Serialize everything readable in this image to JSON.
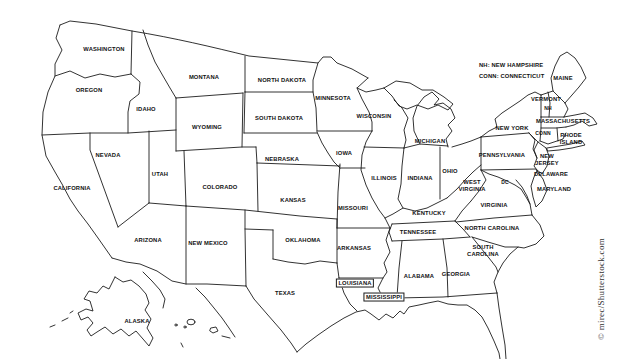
{
  "map": {
    "legend": {
      "line1": "NH: NEW HAMPSHIRE",
      "line2": "CONN: CONNECTICUT"
    },
    "labels": [
      {
        "text": "WASHINGTON",
        "x": 104,
        "y": 49
      },
      {
        "text": "OREGON",
        "x": 89,
        "y": 90
      },
      {
        "text": "IDAHO",
        "x": 146,
        "y": 109
      },
      {
        "text": "MONTANA",
        "x": 204,
        "y": 77
      },
      {
        "text": "WYOMING",
        "x": 207,
        "y": 127
      },
      {
        "text": "NORTH DAKOTA",
        "x": 282,
        "y": 80
      },
      {
        "text": "SOUTH DAKOTA",
        "x": 279,
        "y": 118
      },
      {
        "text": "MINNESOTA",
        "x": 333,
        "y": 98
      },
      {
        "text": "WISCONSIN",
        "x": 374,
        "y": 116
      },
      {
        "text": "MICHIGAN",
        "x": 430,
        "y": 141
      },
      {
        "text": "NEVADA",
        "x": 108,
        "y": 155
      },
      {
        "text": "UTAH",
        "x": 160,
        "y": 174
      },
      {
        "text": "COLORADO",
        "x": 220,
        "y": 187
      },
      {
        "text": "NEBRASKA",
        "x": 282,
        "y": 159
      },
      {
        "text": "IOWA",
        "x": 344,
        "y": 153
      },
      {
        "text": "KANSAS",
        "x": 293,
        "y": 200
      },
      {
        "text": "MISSOURI",
        "x": 353,
        "y": 208
      },
      {
        "text": "ILLINOIS",
        "x": 384,
        "y": 178
      },
      {
        "text": "INDIANA",
        "x": 420,
        "y": 178
      },
      {
        "text": "OHIO",
        "x": 450,
        "y": 171
      },
      {
        "text": "CALIFORNIA",
        "x": 72,
        "y": 188
      },
      {
        "text": "ARIZONA",
        "x": 148,
        "y": 240
      },
      {
        "text": "NEW MEXICO",
        "x": 208,
        "y": 243
      },
      {
        "text": "OKLAHOMA",
        "x": 303,
        "y": 240
      },
      {
        "text": "ARKANSAS",
        "x": 354,
        "y": 248
      },
      {
        "text": "TEXAS",
        "x": 285,
        "y": 293
      },
      {
        "text": "LOUISIANA",
        "x": 355,
        "y": 283,
        "boxed": true
      },
      {
        "text": "MISSISSIPPI",
        "x": 384,
        "y": 297,
        "boxed": true
      },
      {
        "text": "ALABAMA",
        "x": 419,
        "y": 276
      },
      {
        "text": "GEORGIA",
        "x": 456,
        "y": 274
      },
      {
        "text": "TENNESSEE",
        "x": 418,
        "y": 232
      },
      {
        "text": "KENTUCKY",
        "x": 429,
        "y": 213
      },
      {
        "text": "VIRGINIA",
        "x": 494,
        "y": 205
      },
      {
        "lines": [
          "WEST",
          "VIRGINIA"
        ],
        "x": 472,
        "y": 186
      },
      {
        "text": "NORTH CAROLINA",
        "x": 492,
        "y": 228
      },
      {
        "lines": [
          "SOUTH",
          "CAROLINA"
        ],
        "x": 483,
        "y": 251
      },
      {
        "text": "NEW YORK",
        "x": 512,
        "y": 128
      },
      {
        "text": "PENNSYLVANIA",
        "x": 502,
        "y": 155
      },
      {
        "lines": [
          "NEW",
          "JERSEY"
        ],
        "x": 547,
        "y": 160
      },
      {
        "text": "DELAWARE",
        "x": 551,
        "y": 174
      },
      {
        "text": "MARYLAND",
        "x": 554,
        "y": 189
      },
      {
        "text": "DC",
        "x": 505,
        "y": 182,
        "small": true
      },
      {
        "text": "MAINE",
        "x": 563,
        "y": 78
      },
      {
        "text": "VERMONT",
        "x": 546,
        "y": 99
      },
      {
        "text": "NH",
        "x": 548,
        "y": 108,
        "small": true
      },
      {
        "text": "MASSACHUSETTS",
        "x": 563,
        "y": 121
      },
      {
        "text": "CONN",
        "x": 543,
        "y": 133,
        "small": true
      },
      {
        "lines": [
          "RHODE",
          "ISLAND"
        ],
        "x": 571,
        "y": 139
      },
      {
        "text": "ALASKA",
        "x": 137,
        "y": 321
      }
    ]
  },
  "watermark": "© mirec/Shutterstock.com",
  "colors": {
    "background": "#ffffff",
    "line": "#1c1c1c",
    "text": "#111111",
    "watermark": "#333333"
  }
}
